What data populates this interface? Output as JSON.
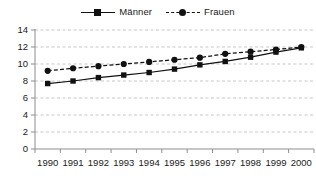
{
  "legend": {
    "position": "top-center",
    "entries": [
      {
        "label": "Männer",
        "marker": "square",
        "line_style": "solid",
        "color": "#111111"
      },
      {
        "label": "Frauen",
        "marker": "circle",
        "line_style": "dashed",
        "color": "#111111"
      }
    ]
  },
  "axes": {
    "y_ticks": [
      "0",
      "2",
      "4",
      "6",
      "8",
      "10",
      "12",
      "14"
    ],
    "x_ticks": [
      "1990",
      "1991",
      "1992",
      "1993",
      "1994",
      "1995",
      "1996",
      "1997",
      "1998",
      "1999",
      "2000"
    ]
  },
  "chart_data": {
    "type": "line",
    "title": "",
    "subtitle": "",
    "xlabel": "",
    "ylabel": "",
    "x": [
      "1990",
      "1991",
      "1992",
      "1993",
      "1994",
      "1995",
      "1996",
      "1997",
      "1998",
      "1999",
      "2000"
    ],
    "categories": [
      "1990",
      "1991",
      "1992",
      "1993",
      "1994",
      "1995",
      "1996",
      "1997",
      "1998",
      "1999",
      "2000"
    ],
    "series": [
      {
        "name": "Männer",
        "marker": "square",
        "line_style": "solid",
        "color": "#111111",
        "values": [
          7.7,
          8.0,
          8.4,
          8.7,
          9.0,
          9.4,
          9.9,
          10.3,
          10.8,
          11.4,
          11.9
        ]
      },
      {
        "name": "Frauen",
        "marker": "circle",
        "line_style": "dashed",
        "color": "#111111",
        "values": [
          9.2,
          9.5,
          9.75,
          10.0,
          10.25,
          10.5,
          10.75,
          11.2,
          11.45,
          11.7,
          12.0
        ]
      }
    ],
    "ylim": [
      0,
      14
    ],
    "ytick_step": 2,
    "grid": "horizontal-dashed",
    "legend_position": "top-center",
    "annotations": []
  },
  "style": {
    "background": "#ffffff",
    "ink": "#111111",
    "grid_color": "#b9b9b9",
    "axis_color": "#8d8d8d"
  }
}
